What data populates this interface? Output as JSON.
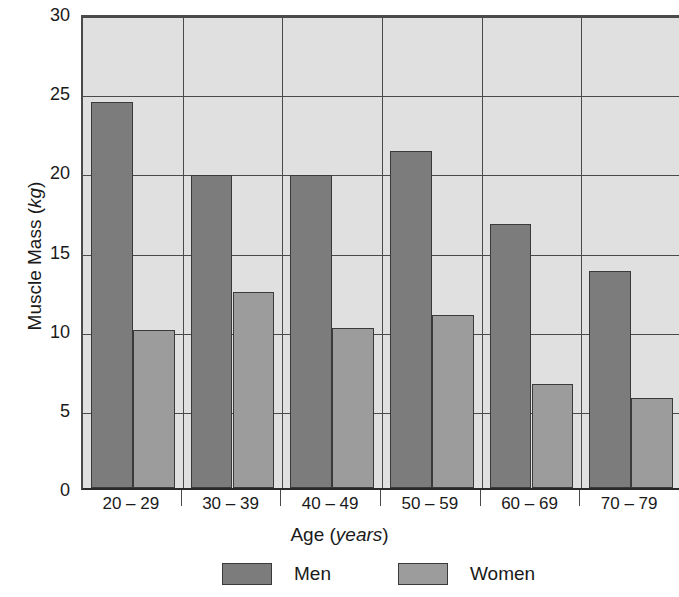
{
  "chart_data": {
    "type": "bar",
    "title": "",
    "xlabel": "Age (years)",
    "xlabel_main": "Age (",
    "xlabel_unit": "years",
    "xlabel_tail": ")",
    "ylabel": "Muscle Mass (kg)",
    "ylabel_main": "Muscle Mass (",
    "ylabel_unit": "kg",
    "ylabel_tail": ")",
    "categories": [
      "20 – 29",
      "30 – 39",
      "40 – 49",
      "50 – 59",
      "60 – 69",
      "70 – 79"
    ],
    "series": [
      {
        "name": "Men",
        "color": "#7c7c7c",
        "values": [
          24.4,
          19.8,
          19.8,
          21.3,
          16.7,
          13.7
        ]
      },
      {
        "name": "Women",
        "color": "#9c9c9c",
        "values": [
          10.0,
          12.4,
          10.1,
          10.9,
          6.6,
          5.7
        ]
      }
    ],
    "ylim": [
      0,
      30
    ],
    "yticks": [
      0,
      5,
      10,
      15,
      20,
      25,
      30
    ],
    "ytick_labels": [
      "0",
      "5",
      "10",
      "15",
      "20",
      "25",
      "30"
    ],
    "grid": true,
    "grid_color": "#4a4a4a",
    "plot_background": "#e0e0e0",
    "legend_position": "bottom",
    "legend": [
      {
        "label": "Men",
        "color": "#7c7c7c"
      },
      {
        "label": "Women",
        "color": "#9c9c9c"
      }
    ]
  }
}
